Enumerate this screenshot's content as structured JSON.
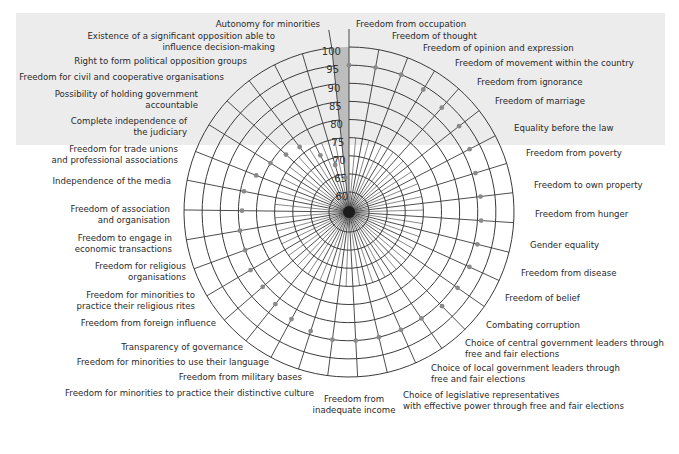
{
  "chart_data": {
    "type": "radar",
    "title": "",
    "scale": {
      "min": 60,
      "max": 100,
      "step": 5,
      "ticks": [
        60,
        65,
        70,
        75,
        80,
        85,
        90,
        95,
        100
      ]
    },
    "grid": true,
    "highlighted_axis_band": "scale wedge between 'Autonomy for minorities' and 'Freedom from occupation'",
    "categories": [
      "Freedom from occupation",
      "Freedom of thought",
      "Freedom of opinion and expression",
      "Freedom of movement within the country",
      "Freedom from ignorance",
      "Freedom of marriage",
      "Equality before the law",
      "Freedom from poverty",
      "Freedom to own property",
      "Freedom from hunger",
      "Gender equality",
      "Freedom from disease",
      "Freedom of belief",
      "Combating corruption",
      "Choice of central government leaders through free and fair elections",
      "Choice of local government leaders through free and fair elections",
      "Choice of legislative representatives with effective power through free and fair elections",
      "Freedom from inadequate income",
      "Freedom for minorities to practice their distinctive culture",
      "Freedom from military bases",
      "Freedom for minorities to use their language",
      "Transparency of governance",
      "Freedom from foreign influence",
      "Freedom for minorities to practice their religious rites",
      "Freedom for religious organisations",
      "Freedom to engage in economic transactions",
      "Freedom of association and organisation",
      "Independence of the media",
      "Freedom for trade unions and professional associations",
      "Complete independence of the judiciary",
      "Possibility of holding government accountable",
      "Freedom for civil and cooperative organisations",
      "Right to form political opposition groups",
      "Existence of a significant opposition able to influence decision-making",
      "Autonomy for minorities"
    ],
    "values": [
      95,
      95,
      95,
      94,
      93,
      93,
      92,
      91,
      91,
      91,
      91,
      91,
      91,
      91,
      90,
      90,
      90,
      90,
      90,
      89,
      88,
      87,
      86,
      86,
      85,
      85,
      84,
      84,
      82,
      80,
      78,
      77,
      72,
      68,
      64
    ]
  },
  "labels_right": [
    {
      "text": [
        "Freedom from occupation"
      ],
      "x": 356,
      "y": 27
    },
    {
      "text": [
        "Freedom of thought"
      ],
      "x": 392,
      "y": 39
    },
    {
      "text": [
        "Freedom of opinion and expression"
      ],
      "x": 423,
      "y": 51
    },
    {
      "text": [
        "Freedom of movement within the country"
      ],
      "x": 455,
      "y": 66
    },
    {
      "text": [
        "Freedom from ignorance"
      ],
      "x": 477,
      "y": 85
    },
    {
      "text": [
        "Freedom of marriage"
      ],
      "x": 495,
      "y": 104
    },
    {
      "text": [
        "Equality before the law"
      ],
      "x": 514,
      "y": 131
    },
    {
      "text": [
        "Freedom from poverty"
      ],
      "x": 526,
      "y": 156
    },
    {
      "text": [
        "Freedom to own property"
      ],
      "x": 534,
      "y": 188
    },
    {
      "text": [
        "Freedom from hunger"
      ],
      "x": 535,
      "y": 217
    },
    {
      "text": [
        "Gender equality"
      ],
      "x": 530,
      "y": 248
    },
    {
      "text": [
        "Freedom from disease"
      ],
      "x": 521,
      "y": 276
    },
    {
      "text": [
        "Freedom of belief"
      ],
      "x": 505,
      "y": 301
    },
    {
      "text": [
        "Combating corruption"
      ],
      "x": 486,
      "y": 328
    },
    {
      "text": [
        "Choice of central government leaders through",
        "free and fair elections"
      ],
      "x": 465,
      "y": 346
    },
    {
      "text": [
        "Choice of local government leaders through",
        "free and fair elections"
      ],
      "x": 431,
      "y": 371
    },
    {
      "text": [
        "Choice of legislative representatives",
        "with effective power through free and fair elections"
      ],
      "x": 403,
      "y": 398
    }
  ],
  "labels_left": [
    {
      "text": [
        "Autonomy for minorities"
      ],
      "right": 320,
      "y": 27
    },
    {
      "text": [
        "Existence of a significant opposition able to",
        "influence decision-making"
      ],
      "right": 275,
      "y": 39
    },
    {
      "text": [
        "Right to form political opposition groups"
      ],
      "right": 247,
      "y": 64
    },
    {
      "text": [
        "Freedom for civil and cooperative organisations"
      ],
      "right": 224,
      "y": 80
    },
    {
      "text": [
        "Possibility of holding government",
        "accountable"
      ],
      "right": 198,
      "y": 97
    },
    {
      "text": [
        "Complete independence of",
        "the judiciary"
      ],
      "right": 187,
      "y": 124
    },
    {
      "text": [
        "Freedom for trade unions",
        "and professional associations"
      ],
      "right": 178,
      "y": 152
    },
    {
      "text": [
        "Independence of the media"
      ],
      "right": 171,
      "y": 184
    },
    {
      "text": [
        "Freedom of  association",
        "and organisation"
      ],
      "right": 170,
      "y": 212
    },
    {
      "text": [
        "Freedom to engage in",
        "economic transactions"
      ],
      "right": 172,
      "y": 241
    },
    {
      "text": [
        "Freedom for religious",
        "organisations"
      ],
      "right": 186,
      "y": 269
    },
    {
      "text": [
        "Freedom for minorities to",
        "practice their religious rites"
      ],
      "right": 195,
      "y": 298
    },
    {
      "text": [
        "Freedom from foreign influence"
      ],
      "right": 216,
      "y": 326
    },
    {
      "text": [
        "Transparency of governance"
      ],
      "right": 243,
      "y": 350
    },
    {
      "text": [
        "Freedom for minorities to use their language"
      ],
      "right": 269,
      "y": 365
    },
    {
      "text": [
        "Freedom from military bases"
      ],
      "right": 302,
      "y": 380
    },
    {
      "text": [
        "Freedom for minorities to practice their distinctive culture"
      ],
      "right": 314,
      "y": 396
    }
  ],
  "label_bottom": {
    "text": [
      "Freedom from",
      "inadequate income"
    ],
    "center": 354,
    "y": 402
  },
  "colors": {
    "background": "#ececec",
    "grid": "#3a3a3a",
    "band": "#bdbdbd",
    "dot": "#8a8a8a",
    "text": "#2a2a2a"
  }
}
